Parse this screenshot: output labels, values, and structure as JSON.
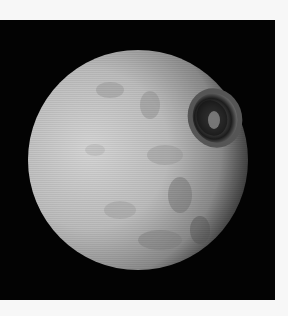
{
  "image": {
    "subject": "Cratered moon (Mimas) with large impact crater",
    "background_color": "#030303",
    "border_color": "#f7f7f7",
    "moon": {
      "center": [
        138,
        140
      ],
      "radius": 110,
      "surface_color": "#bdbdbd",
      "shadow_color": "#2a2a2a"
    },
    "crater": {
      "label": "large crater",
      "center": [
        215,
        98
      ],
      "radius": 28
    }
  }
}
